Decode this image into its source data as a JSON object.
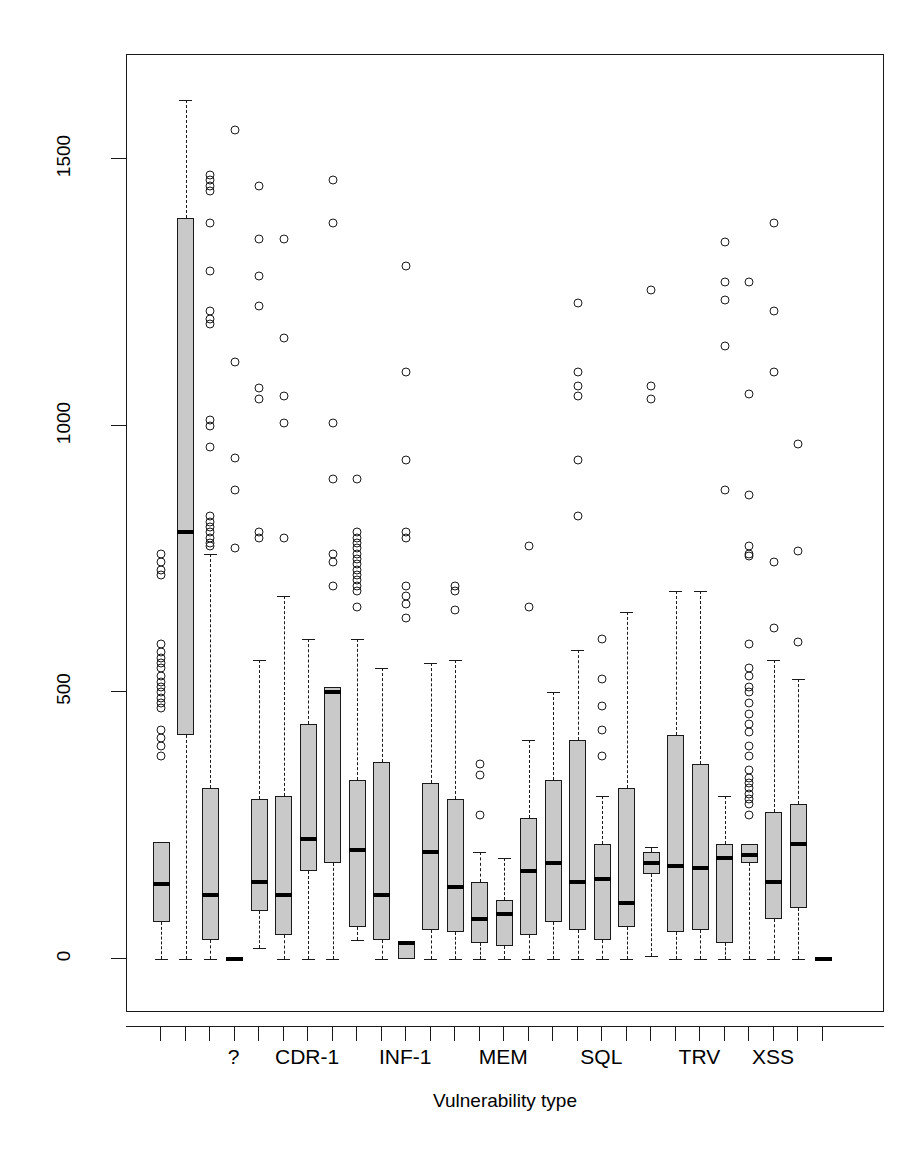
{
  "chart_data": {
    "type": "box",
    "title": "",
    "xlabel": "Vulnerability type",
    "ylabel": "Vulnerability fix time",
    "ylim": [
      -40,
      1640
    ],
    "yticks": [
      0,
      500,
      1000,
      1500
    ],
    "ytick_labels": [
      "0",
      "500",
      "1000",
      "1500"
    ],
    "grid": false,
    "legend": null,
    "n_boxes": 28,
    "xtick_labels_shown": [
      "?",
      "CDR-1",
      "INF-1",
      "MEM",
      "SQL",
      "TRV",
      "XSS"
    ],
    "xtick_label_positions": [
      4,
      7,
      11,
      15,
      19,
      23,
      26
    ],
    "boxes": [
      {
        "index": 1,
        "category": "",
        "lower_whisker": 0,
        "q1": 70,
        "median": 140,
        "q3": 220,
        "upper_whisker": 220,
        "outliers": [
          380,
          400,
          415,
          430,
          470,
          480,
          490,
          500,
          510,
          520,
          530,
          545,
          555,
          565,
          575,
          590,
          720,
          730,
          745,
          760
        ]
      },
      {
        "index": 2,
        "category": "",
        "lower_whisker": 0,
        "q1": 420,
        "median": 800,
        "q3": 1390,
        "upper_whisker": 1610,
        "outliers": []
      },
      {
        "index": 3,
        "category": "",
        "lower_whisker": 0,
        "q1": 35,
        "median": 120,
        "q3": 320,
        "upper_whisker": 760,
        "outliers": [
          775,
          780,
          790,
          800,
          810,
          820,
          830,
          960,
          1000,
          1010,
          1190,
          1200,
          1215,
          1290,
          1380,
          1440,
          1450,
          1460,
          1470
        ]
      },
      {
        "index": 4,
        "category": "?",
        "lower_whisker": 0,
        "q1": 0,
        "median": 0,
        "q3": 0,
        "upper_whisker": 0,
        "outliers": [
          1555,
          1120,
          940,
          880,
          770
        ]
      },
      {
        "index": 5,
        "category": "",
        "lower_whisker": 20,
        "q1": 90,
        "median": 145,
        "q3": 300,
        "upper_whisker": 560,
        "outliers": [
          790,
          800,
          1050,
          1070,
          1225,
          1280,
          1350,
          1450
        ]
      },
      {
        "index": 6,
        "category": "CDR-1",
        "lower_whisker": 0,
        "q1": 45,
        "median": 120,
        "q3": 305,
        "upper_whisker": 680,
        "outliers": [
          790,
          1005,
          1055,
          1165,
          1350
        ]
      },
      {
        "index": 7,
        "category": "",
        "lower_whisker": 0,
        "q1": 165,
        "median": 225,
        "q3": 440,
        "upper_whisker": 600,
        "outliers": []
      },
      {
        "index": 8,
        "category": "",
        "lower_whisker": 0,
        "q1": 180,
        "median": 500,
        "q3": 510,
        "upper_whisker": 510,
        "outliers": [
          700,
          745,
          760,
          900,
          1005,
          1380,
          1460
        ]
      },
      {
        "index": 9,
        "category": "INF-1",
        "lower_whisker": 35,
        "q1": 60,
        "median": 205,
        "q3": 335,
        "upper_whisker": 600,
        "outliers": [
          660,
          690,
          700,
          710,
          720,
          730,
          740,
          750,
          760,
          770,
          780,
          790,
          800,
          900
        ]
      },
      {
        "index": 10,
        "category": "",
        "lower_whisker": 0,
        "q1": 35,
        "median": 120,
        "q3": 370,
        "upper_whisker": 545,
        "outliers": []
      },
      {
        "index": 11,
        "category": "",
        "lower_whisker": 0,
        "q1": 0,
        "median": 30,
        "q3": 30,
        "upper_whisker": 30,
        "outliers": [
          640,
          665,
          680,
          700,
          790,
          800,
          935,
          1100,
          1300
        ]
      },
      {
        "index": 12,
        "category": "",
        "lower_whisker": 0,
        "q1": 55,
        "median": 200,
        "q3": 330,
        "upper_whisker": 555,
        "outliers": []
      },
      {
        "index": 13,
        "category": "MEM",
        "lower_whisker": 0,
        "q1": 50,
        "median": 135,
        "q3": 300,
        "upper_whisker": 560,
        "outliers": [
          655,
          690,
          700
        ]
      },
      {
        "index": 14,
        "category": "",
        "lower_whisker": 0,
        "q1": 30,
        "median": 75,
        "q3": 145,
        "upper_whisker": 200,
        "outliers": [
          270,
          345,
          365
        ]
      },
      {
        "index": 15,
        "category": "",
        "lower_whisker": 0,
        "q1": 25,
        "median": 85,
        "q3": 110,
        "upper_whisker": 190,
        "outliers": []
      },
      {
        "index": 16,
        "category": "",
        "lower_whisker": 0,
        "q1": 45,
        "median": 165,
        "q3": 265,
        "upper_whisker": 410,
        "outliers": [
          660,
          775
        ]
      },
      {
        "index": 17,
        "category": "SQL",
        "lower_whisker": 0,
        "q1": 70,
        "median": 180,
        "q3": 335,
        "upper_whisker": 500,
        "outliers": []
      },
      {
        "index": 18,
        "category": "",
        "lower_whisker": 0,
        "q1": 55,
        "median": 145,
        "q3": 410,
        "upper_whisker": 580,
        "outliers": [
          830,
          935,
          1055,
          1075,
          1100,
          1230
        ]
      },
      {
        "index": 19,
        "category": "",
        "lower_whisker": 0,
        "q1": 35,
        "median": 150,
        "q3": 215,
        "upper_whisker": 305,
        "outliers": [
          380,
          430,
          475,
          525,
          600
        ]
      },
      {
        "index": 20,
        "category": "",
        "lower_whisker": 0,
        "q1": 60,
        "median": 105,
        "q3": 320,
        "upper_whisker": 650,
        "outliers": []
      },
      {
        "index": 21,
        "category": "TRV",
        "lower_whisker": 5,
        "q1": 160,
        "median": 180,
        "q3": 200,
        "upper_whisker": 210,
        "outliers": [
          1050,
          1075,
          1255
        ]
      },
      {
        "index": 22,
        "category": "",
        "lower_whisker": 0,
        "q1": 50,
        "median": 175,
        "q3": 420,
        "upper_whisker": 690,
        "outliers": []
      },
      {
        "index": 23,
        "category": "",
        "lower_whisker": 0,
        "q1": 55,
        "median": 170,
        "q3": 365,
        "upper_whisker": 690,
        "outliers": []
      },
      {
        "index": 24,
        "category": "",
        "lower_whisker": 0,
        "q1": 30,
        "median": 190,
        "q3": 215,
        "upper_whisker": 305,
        "outliers": [
          880,
          1150,
          1235,
          1270,
          1345
        ]
      },
      {
        "index": 25,
        "category": "XSS",
        "lower_whisker": 0,
        "q1": 180,
        "median": 195,
        "q3": 215,
        "upper_whisker": 215,
        "outliers": [
          270,
          290,
          300,
          310,
          320,
          330,
          340,
          355,
          380,
          400,
          425,
          440,
          460,
          480,
          500,
          510,
          530,
          545,
          590,
          755,
          760,
          775,
          870,
          1060,
          1270
        ]
      },
      {
        "index": 26,
        "category": "",
        "lower_whisker": 0,
        "q1": 75,
        "median": 145,
        "q3": 275,
        "upper_whisker": 560,
        "outliers": [
          620,
          745,
          1100,
          1215,
          1380
        ]
      },
      {
        "index": 27,
        "category": "",
        "lower_whisker": 0,
        "q1": 95,
        "median": 215,
        "q3": 290,
        "upper_whisker": 525,
        "outliers": [
          595,
          765,
          965
        ]
      },
      {
        "index": 28,
        "category": "",
        "lower_whisker": 0,
        "q1": 0,
        "median": 0,
        "q3": 0,
        "upper_whisker": 0,
        "outliers": []
      }
    ],
    "colors": {
      "box_fill": "#c9c9c9",
      "stroke": "#1a1a1a",
      "median": "#000000"
    }
  },
  "axes": {
    "y_title": "Vulnerability fix time",
    "x_title": "Vulnerability type"
  }
}
